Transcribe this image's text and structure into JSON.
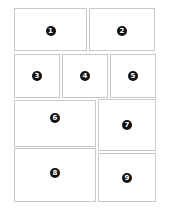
{
  "layout": {
    "panels": [
      {
        "id": 1,
        "label": "1"
      },
      {
        "id": 2,
        "label": "2"
      },
      {
        "id": 3,
        "label": "3"
      },
      {
        "id": 4,
        "label": "4"
      },
      {
        "id": 5,
        "label": "5"
      },
      {
        "id": 6,
        "label": "6"
      },
      {
        "id": 7,
        "label": "7"
      },
      {
        "id": 8,
        "label": "8"
      },
      {
        "id": 9,
        "label": "9"
      }
    ]
  },
  "colors": {
    "border": "#c8c8c8",
    "badge": "#111111",
    "badge_text": "#ffffff"
  }
}
